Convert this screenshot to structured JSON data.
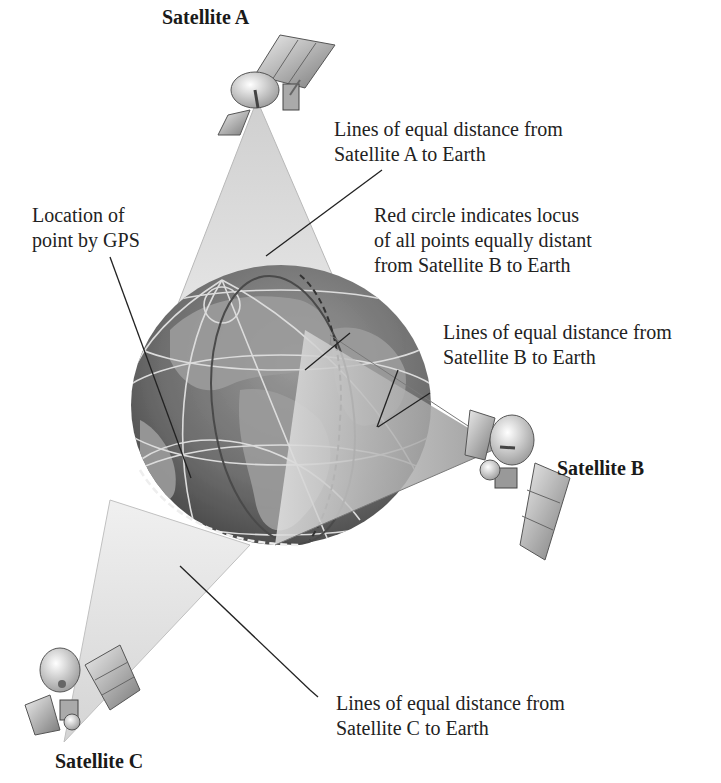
{
  "satellites": [
    {
      "id": "A",
      "name": "Satellite A"
    },
    {
      "id": "B",
      "name": "Satellite B"
    },
    {
      "id": "C",
      "name": "Satellite C"
    }
  ],
  "labels": {
    "satellite_a_lines": [
      "Lines of equal distance from",
      "Satellite A to Earth"
    ],
    "red_circle": [
      "Red circle indicates locus",
      "of all points equally distant",
      "from Satellite B to Earth"
    ],
    "gps_location": [
      "Location of",
      "point by GPS"
    ],
    "satellite_b_lines": [
      "Lines of equal distance from",
      "Satellite B to Earth"
    ],
    "satellite_c_lines": [
      "Lines of equal distance from",
      "Satellite C to Earth"
    ]
  },
  "colors": {
    "cone_light": "#e6e6e6",
    "cone_dark": "#9a9a9a",
    "earth_ocean": "#5a5a5a",
    "earth_land": "#8c8c8c",
    "grid_lines": "#d8d8d8",
    "leader_line": "#222222"
  }
}
